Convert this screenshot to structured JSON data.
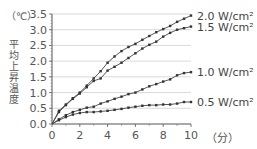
{
  "chart_data": {
    "type": "line",
    "title": "",
    "xlabel": "（分）",
    "ylabel": "平均上昇温度",
    "yunit": "（℃）",
    "xlim": [
      0,
      10
    ],
    "ylim": [
      0,
      3.5
    ],
    "xticks": [
      0,
      2,
      4,
      6,
      8,
      10
    ],
    "xtick_labels": [
      "0",
      "2",
      "4",
      "6",
      "8",
      "10"
    ],
    "yticks": [
      0.0,
      0.5,
      1.0,
      1.5,
      2.0,
      2.5,
      3.0,
      3.5
    ],
    "ytick_labels": [
      "0.0",
      "0.5",
      "1.0",
      "1.5",
      "2.0",
      "2.5",
      "3.0",
      "3.5"
    ],
    "grid": "horizontal",
    "legend": "inline-right",
    "x": [
      0,
      0.5,
      1,
      1.5,
      2,
      2.5,
      3,
      3.5,
      4,
      4.5,
      5,
      5.5,
      6,
      6.5,
      7,
      7.5,
      8,
      8.5,
      9,
      9.5,
      10
    ],
    "series": [
      {
        "name": "2.0 W/cm²",
        "values": [
          0,
          0.42,
          0.62,
          0.82,
          1.0,
          1.22,
          1.45,
          1.68,
          1.95,
          2.15,
          2.32,
          2.45,
          2.55,
          2.68,
          2.8,
          2.92,
          3.02,
          3.12,
          3.25,
          3.35,
          3.45
        ]
      },
      {
        "name": "1.5 W/cm²",
        "values": [
          0,
          0.38,
          0.6,
          0.8,
          0.97,
          1.17,
          1.37,
          1.45,
          1.7,
          1.82,
          1.95,
          2.1,
          2.25,
          2.4,
          2.52,
          2.62,
          2.78,
          2.9,
          3.0,
          3.05,
          3.1
        ]
      },
      {
        "name": "1.0 W/cm²",
        "values": [
          0,
          0.15,
          0.28,
          0.38,
          0.45,
          0.52,
          0.55,
          0.65,
          0.72,
          0.8,
          0.87,
          0.95,
          1.0,
          1.1,
          1.2,
          1.27,
          1.35,
          1.42,
          1.55,
          1.62,
          1.65
        ]
      },
      {
        "name": "0.5 W/cm²",
        "values": [
          0,
          0.12,
          0.22,
          0.3,
          0.35,
          0.38,
          0.38,
          0.4,
          0.42,
          0.45,
          0.48,
          0.52,
          0.55,
          0.58,
          0.6,
          0.6,
          0.62,
          0.62,
          0.65,
          0.7,
          0.7
        ]
      }
    ]
  }
}
